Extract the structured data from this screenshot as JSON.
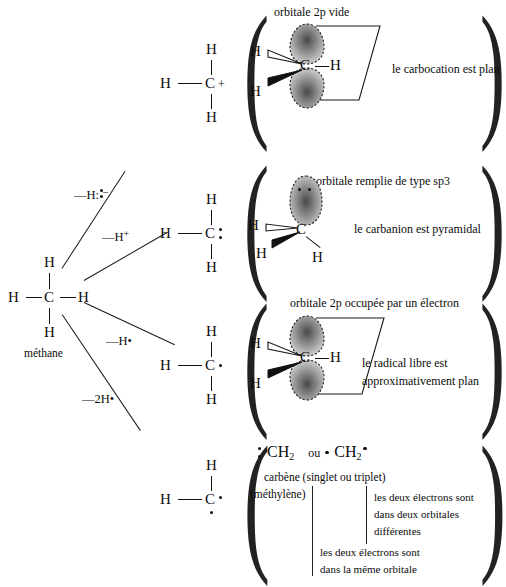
{
  "diagram": {
    "language": "fr"
  },
  "source": {
    "name": "méthane",
    "formula_atoms": {
      "center": "C",
      "h_left": "H",
      "h_right": "H",
      "h_top": "H",
      "h_bottom": "H"
    },
    "caption": "méthane"
  },
  "branches": [
    {
      "id": "carbocation",
      "reagent": "—H:",
      "reagent_charge": "–"
    },
    {
      "id": "carbanion",
      "reagent": "—H",
      "reagent_charge": "+"
    },
    {
      "id": "radical",
      "reagent": "—H•",
      "reagent_charge": ""
    },
    {
      "id": "carbene",
      "reagent": "—2H•",
      "reagent_charge": ""
    }
  ],
  "intermediates": [
    {
      "id": "carbocation",
      "atoms": {
        "h_left": "H",
        "center": "C",
        "h_top": "H",
        "h_bottom": "H"
      },
      "charge": "+",
      "dots": []
    },
    {
      "id": "carbanion",
      "atoms": {
        "h_left": "H",
        "center": "C",
        "h_top": "H",
        "h_bottom": "H"
      },
      "charge": "",
      "dots": [
        "lone-pair-right"
      ]
    },
    {
      "id": "radical",
      "atoms": {
        "h_left": "H",
        "center": "C",
        "h_top": "H",
        "h_bottom": "H"
      },
      "charge": "",
      "dots": [
        "single-electron-right"
      ]
    },
    {
      "id": "carbene",
      "atoms": {
        "h_left": "H",
        "center": "C",
        "h_top": "H",
        "h_bottom": ""
      },
      "charge": "",
      "dots": [
        "electron-right",
        "electron-below"
      ]
    }
  ],
  "panels": [
    {
      "id": "carbocation-panel",
      "orbital_label": "orbitale 2p vide",
      "conclusion": "le carbocation est plan",
      "model_atoms": {
        "center": "C",
        "h_wedge_up": "H",
        "h_wedge_down": "H",
        "h_right": "H"
      },
      "lobes": 2,
      "lobe_electrons": 0
    },
    {
      "id": "carbanion-panel",
      "orbital_label": "orbitale remplie de type sp3",
      "conclusion": "le carbanion est pyramidal",
      "model_atoms": {
        "center": "C",
        "h_left": "H",
        "h_wedge": "H",
        "h_bottom": "H"
      },
      "lobes": 1,
      "lobe_electrons": 2
    },
    {
      "id": "radical-panel",
      "orbital_label": "orbitale 2p occupée par un électron",
      "conclusion_line1": "le radical libre est",
      "conclusion_line2": "approximativement  plan",
      "model_atoms": {
        "center": "C",
        "h_wedge_up": "H",
        "h_wedge_down": "H",
        "h_right": "H"
      },
      "lobes": 2,
      "lobe_electrons": 1
    },
    {
      "id": "carbene-panel",
      "formula_singlet": "CH",
      "formula_singlet_sub": "2",
      "conjunction": "ou",
      "formula_triplet": "CH",
      "formula_triplet_sub": "2",
      "caption_line1": "carbène (singlet ou triplet)",
      "caption_line2": "(méthylène)",
      "note_triplet_line1": "les deux électrons sont",
      "note_triplet_line2": "dans deux  orbitales",
      "note_triplet_line3": "différentes",
      "note_singlet_line1": "les deux électrons sont",
      "note_singlet_line2": "dans la même orbitale"
    }
  ],
  "colors": {
    "ink": "#0c0c0c",
    "line": "#1a1a1a",
    "paper": "#ffffff",
    "orbital_fill": "#8c8c8c",
    "orbital_core": "#5a5a5a"
  }
}
